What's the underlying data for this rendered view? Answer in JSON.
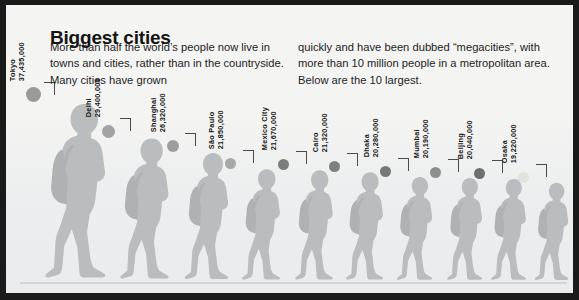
{
  "headline": "Biggest cities",
  "intro": {
    "left_column": "More than half the world’s people now live in towns and cities, rather than in the countryside. Many cities have grown",
    "right_column": "quickly and have been dubbed “megacities”, with more than 10 million people in a metropolitan area. Below are the 10 largest."
  },
  "chart_data": {
    "type": "bar",
    "title": "Biggest cities",
    "xlabel": "",
    "ylabel": "Population (metropolitan area)",
    "unit": "people",
    "grid": false,
    "legend": false,
    "note": "Pictogram chart — walking-person silhouettes scaled by population; a colour-coded dot precedes each figure.",
    "categories": [
      "Tokyo",
      "Delhi",
      "Shanghai",
      "São Paulo",
      "Mexico City",
      "Cairo",
      "Dhaka",
      "Mumbai",
      "Beijing",
      "Osaka"
    ],
    "values": [
      37435000,
      29400000,
      26320000,
      21850000,
      21670000,
      21320000,
      20280000,
      20190000,
      20040000,
      19220000
    ],
    "value_labels": [
      "37,435,000",
      "29,400,000",
      "26,320,000",
      "21,850,000",
      "21,670,000",
      "21,320,000",
      "20,280,000",
      "20,190,000",
      "20,040,000",
      "19,220,000"
    ],
    "ylim": [
      0,
      37435000
    ]
  },
  "colors": {
    "page_background": "#f4f4f2",
    "frame": "#1a1a1a",
    "text": "#161616",
    "figure_fill": "#b9bdbf",
    "ground_line": "#d3d6d8",
    "leader_line": "#4a4a4a"
  },
  "cities": [
    {
      "name": "Tokyo",
      "population": "37,435,000",
      "dot_color": "#9a9a9a",
      "figure_height": 186,
      "left": 20,
      "dot_size": 15
    },
    {
      "name": "Delhi",
      "population": "29,400,000",
      "dot_color": "#a3a3a3",
      "figure_height": 150,
      "left": 96,
      "dot_size": 13
    },
    {
      "name": "Shanghai",
      "population": "26,320,000",
      "dot_color": "#9d9d9d",
      "figure_height": 135,
      "left": 161,
      "dot_size": 12
    },
    {
      "name": "São Paulo",
      "population": "21,850,000",
      "dot_color": "#a8a8a8",
      "figure_height": 118,
      "left": 219,
      "dot_size": 11
    },
    {
      "name": "Mexico City",
      "population": "21,670,000",
      "dot_color": "#7b7b7b",
      "figure_height": 117,
      "left": 272,
      "dot_size": 11
    },
    {
      "name": "Cairo",
      "population": "21,320,000",
      "dot_color": "#7f7f7f",
      "figure_height": 115,
      "left": 323,
      "dot_size": 11
    },
    {
      "name": "Dhaka",
      "population": "20,280,000",
      "dot_color": "#777777",
      "figure_height": 110,
      "left": 374,
      "dot_size": 11
    },
    {
      "name": "Mumbai",
      "population": "20,190,000",
      "dot_color": "#8e8e8e",
      "figure_height": 109,
      "left": 424,
      "dot_size": 11
    },
    {
      "name": "Beijing",
      "population": "20,040,000",
      "dot_color": "#6e6e6e",
      "figure_height": 108,
      "left": 468,
      "dot_size": 11
    },
    {
      "name": "Osaka",
      "population": "19,220,000",
      "dot_color": "#e2e2e0",
      "figure_height": 104,
      "left": 512,
      "dot_size": 11
    }
  ]
}
